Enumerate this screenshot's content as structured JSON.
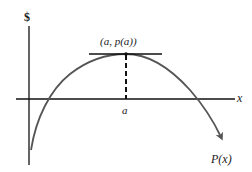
{
  "figure": {
    "y_axis_label": "$",
    "x_axis_label": "x",
    "peak_point_label": "(a, p(a))",
    "peak_x_tick_label": "a",
    "curve_label": "P(x)"
  },
  "elements": {
    "curve": "concave-down parabola-like profit curve with a single maximum",
    "tangent": "horizontal tangent line at the maximum",
    "dashed_guide": "vertical dashed line from maximum down to x-axis at a"
  },
  "colors": {
    "axes": "#111111",
    "curve": "#555555",
    "text": "#1a1a1a"
  }
}
